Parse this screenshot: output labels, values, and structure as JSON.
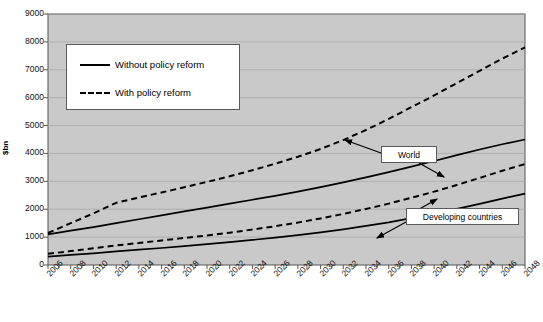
{
  "chart_data": {
    "type": "line",
    "title": "",
    "xlabel": "",
    "ylabel": "$bn",
    "ylim": [
      0,
      9000
    ],
    "ytick_step": 1000,
    "grid": true,
    "plot_background": "#c9c9c9",
    "line_color": "#000000",
    "legend_position": "top-left",
    "x": [
      2006,
      2008,
      2010,
      2012,
      2014,
      2016,
      2018,
      2020,
      2022,
      2024,
      2026,
      2028,
      2030,
      2032,
      2034,
      2036,
      2038,
      2040,
      2042,
      2044,
      2046,
      2048
    ],
    "xtick_labels": [
      "2006",
      "2008",
      "2010",
      "2012",
      "2014",
      "2016",
      "2018",
      "2020",
      "2022",
      "2024",
      "2026",
      "2028",
      "2030",
      "2032",
      "2034",
      "2036",
      "2038",
      "2040",
      "2042",
      "2044",
      "2046",
      "2048"
    ],
    "ytick_labels": [
      "0",
      "1000",
      "2000",
      "3000",
      "4000",
      "5000",
      "6000",
      "7000",
      "8000",
      "9000"
    ],
    "series": [
      {
        "name": "World - With policy reform",
        "group": "World",
        "style": "dashed",
        "values": [
          1150,
          1500,
          1850,
          2230,
          2420,
          2600,
          2790,
          2980,
          3180,
          3400,
          3630,
          3880,
          4160,
          4480,
          4840,
          5240,
          5660,
          6080,
          6520,
          6960,
          7400,
          7800
        ]
      },
      {
        "name": "World - Without policy reform",
        "group": "World",
        "style": "solid",
        "values": [
          1100,
          1230,
          1360,
          1500,
          1640,
          1780,
          1920,
          2060,
          2200,
          2340,
          2480,
          2630,
          2790,
          2960,
          3140,
          3330,
          3530,
          3730,
          3940,
          4140,
          4330,
          4500
        ]
      },
      {
        "name": "Developing countries - With policy reform",
        "group": "Developing countries",
        "style": "dashed",
        "values": [
          400,
          500,
          600,
          700,
          790,
          880,
          970,
          1060,
          1160,
          1270,
          1390,
          1520,
          1670,
          1830,
          2010,
          2200,
          2410,
          2630,
          2870,
          3120,
          3380,
          3620
        ]
      },
      {
        "name": "Developing countries - Without policy reform",
        "group": "Developing countries",
        "style": "solid",
        "values": [
          300,
          360,
          420,
          490,
          550,
          610,
          680,
          750,
          820,
          900,
          980,
          1070,
          1170,
          1280,
          1400,
          1530,
          1680,
          1840,
          2010,
          2190,
          2380,
          2560
        ]
      }
    ],
    "legend": [
      {
        "label": "Without policy reform",
        "style": "solid"
      },
      {
        "label": "With policy reform",
        "style": "dashed"
      }
    ],
    "annotations": [
      {
        "label": "World"
      },
      {
        "label": "Developing countries"
      }
    ]
  }
}
